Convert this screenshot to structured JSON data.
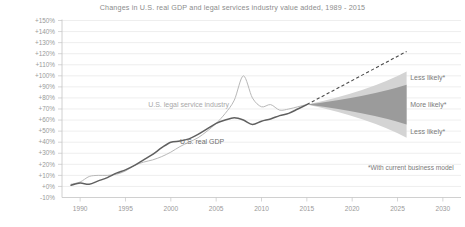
{
  "chart_data": {
    "type": "line",
    "title": "Changes in U.S. real GDP and legal services industry value added, 1989 - 2015",
    "xlabel": "",
    "ylabel": "",
    "xlim": [
      1988,
      2032
    ],
    "ylim": [
      -10,
      150
    ],
    "grid": true,
    "legend_position": "inline-annotation",
    "y_ticks": [
      "+150%",
      "+140%",
      "+130%",
      "+120%",
      "+110%",
      "+100%",
      "+90%",
      "+80%",
      "+70%",
      "+60%",
      "+50%",
      "+40%",
      "+30%",
      "+20%",
      "+10%",
      "+0%",
      "-10%"
    ],
    "y_tick_values": [
      150,
      140,
      130,
      120,
      110,
      100,
      90,
      80,
      70,
      60,
      50,
      40,
      30,
      20,
      10,
      0,
      -10
    ],
    "x_ticks": [
      "1990",
      "1995",
      "2000",
      "2005",
      "2010",
      "2015",
      "2020",
      "2025",
      "2030"
    ],
    "x_tick_values": [
      1990,
      1995,
      2000,
      2005,
      2010,
      2015,
      2020,
      2025,
      2030
    ],
    "series": [
      {
        "name": "U.S. legal service industry",
        "color": "#b8b8b8",
        "label_x": 1997.5,
        "label_y": 72,
        "x": [
          1989,
          1990,
          1991,
          1992,
          1993,
          1994,
          1995,
          1996,
          1997,
          1998,
          1999,
          2000,
          2001,
          2002,
          2003,
          2004,
          2005,
          2006,
          2007,
          2008,
          2009,
          2010,
          2011,
          2012,
          2013,
          2014,
          2015
        ],
        "values": [
          2,
          4,
          9,
          10,
          10,
          11,
          14,
          19,
          22,
          24,
          27,
          31,
          36,
          40,
          44,
          50,
          57,
          66,
          78,
          100,
          80,
          72,
          74,
          69,
          70,
          72,
          74
        ]
      },
      {
        "name": "U.S. real GDP",
        "color": "#606060",
        "label_x": 2001.0,
        "label_y": 38,
        "x": [
          1989,
          1990,
          1991,
          1992,
          1993,
          1994,
          1995,
          1996,
          1997,
          1998,
          1999,
          2000,
          2001,
          2002,
          2003,
          2004,
          2005,
          2006,
          2007,
          2008,
          2009,
          2010,
          2011,
          2012,
          2013,
          2014,
          2015
        ],
        "values": [
          1,
          3,
          2,
          5,
          8,
          12,
          15,
          19,
          24,
          29,
          35,
          40,
          41,
          43,
          47,
          52,
          57,
          60,
          62,
          60,
          56,
          59,
          61,
          64,
          66,
          70,
          74
        ]
      }
    ],
    "projection": {
      "origin_x": 2015,
      "origin_y": 74,
      "end_x": 2026,
      "outer_band": {
        "name": "Less likely*",
        "color": "#d4d4d4",
        "upper_end": 104,
        "lower_end": 44
      },
      "inner_band": {
        "name": "More likely*",
        "color": "#9b9b9b",
        "upper_end": 92,
        "lower_end": 56
      },
      "trend_line": {
        "name": "current-trend-dashed",
        "color": "#4a4a4a",
        "end_x": 2026,
        "end_y": 122
      }
    },
    "annotations": [
      {
        "name": "less-likely-upper",
        "text": "Less likely*",
        "x": 2026.4,
        "y": 98
      },
      {
        "name": "more-likely",
        "text": "More likely*",
        "x": 2026.4,
        "y": 74
      },
      {
        "name": "less-likely-lower",
        "text": "Less likely*",
        "x": 2026.4,
        "y": 50
      }
    ],
    "footnote": "*With current business model"
  },
  "colors": {
    "grid": "#e6e6e6",
    "axis": "#c4c4c4",
    "text": "#8a8a8a",
    "legal_line": "#b8b8b8",
    "gdp_line": "#606060",
    "band_outer": "#d4d4d4",
    "band_inner": "#9b9b9b",
    "dashed": "#4a4a4a"
  }
}
